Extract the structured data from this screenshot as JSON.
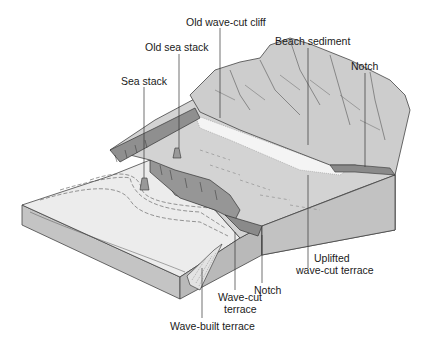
{
  "diagram": {
    "labels": {
      "old_wave_cut_cliff": "Old wave-cut cliff",
      "old_sea_stack": "Old sea stack",
      "beach_sediment": "Beach sediment",
      "sea_stack": "Sea stack",
      "notch_upper": "Notch",
      "uplifted_terrace_1": "Uplifted",
      "uplifted_terrace_2": "wave-cut terrace",
      "notch_lower": "Notch",
      "wave_cut_terrace_1": "Wave-cut",
      "wave_cut_terrace_2": "terrace",
      "wave_built_terrace": "Wave-built terrace"
    },
    "colors": {
      "background": "#ffffff",
      "sea_surface": "#ececec",
      "block_front": "#c8c8c8",
      "block_side": "#b5b5b5",
      "terrace": "#d6d6d6",
      "mountain": "#cfcfcf",
      "cliff": "#8f8f8f",
      "beach": "#f2f2f2",
      "line": "#333333"
    }
  }
}
